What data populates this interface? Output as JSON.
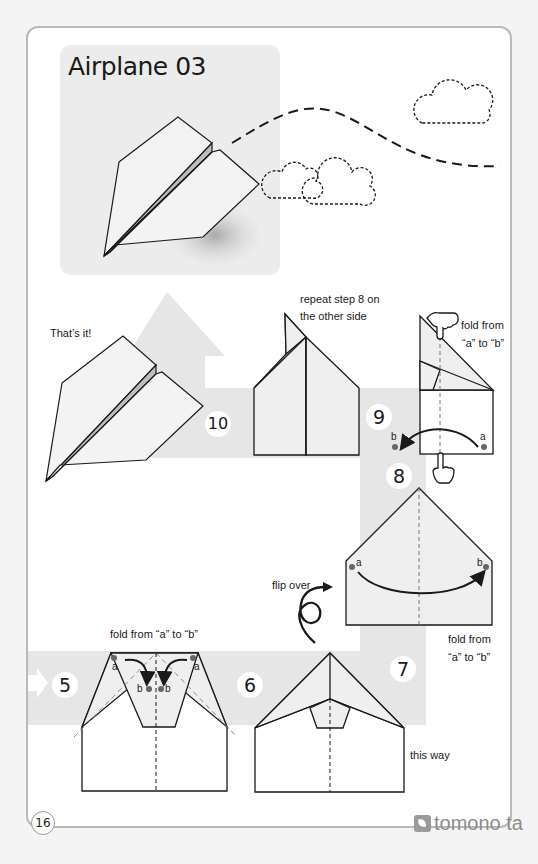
{
  "page": {
    "title": "Airplane 03",
    "page_number": "16",
    "brand": "tomono ta",
    "colors": {
      "band_gray": "#e6e6e6",
      "paper_gray": "#efefef",
      "line": "#1a1a1a",
      "dot": "#666666",
      "frame": "#b9b9b9"
    }
  },
  "steps": [
    {
      "number": "5",
      "instruction": "fold from “a” to “b”",
      "markers": [
        "a",
        "b",
        "b",
        "a"
      ]
    },
    {
      "number": "6",
      "instruction": "",
      "markers": []
    },
    {
      "number": "7",
      "instruction": "fold from “a” to “b” this way",
      "note_line1": "fold from",
      "note_line2": "“a” to “b”",
      "note_line3": "this way",
      "markers": []
    },
    {
      "number": "8",
      "instruction": "flip over",
      "markers": [
        "a",
        "b"
      ]
    },
    {
      "number": "9",
      "instruction": "fold from “a” to “b”",
      "note_line1": "fold from",
      "note_line2": "“a” to “b”",
      "markers": [
        "b",
        "a"
      ]
    },
    {
      "number": "10",
      "instruction": "repeat step 8 on the other side",
      "note_line1": "repeat step 8 on",
      "note_line2": "the other side",
      "markers": []
    }
  ],
  "labels": {
    "thats_it": "That’s it!",
    "flip_over": "flip over",
    "marker_a": "a",
    "marker_b": "b"
  },
  "icons": [
    "cloud-icon",
    "hand-pointer-icon",
    "flip-arrow-icon",
    "curved-arrow-icon",
    "right-arrow-icon",
    "up-arrow-icon"
  ]
}
